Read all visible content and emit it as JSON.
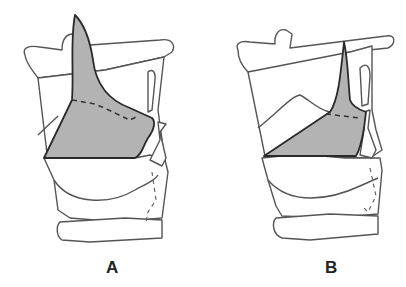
{
  "figure": {
    "panels": [
      {
        "label": "A",
        "description": "Lateral larynx diagram with large shaded epiglottic region"
      },
      {
        "label": "B",
        "description": "Lateral larynx diagram with smaller shaded region"
      }
    ],
    "colors": {
      "shade": "#b3b3b3",
      "outline": "#555555",
      "background": "#ffffff"
    }
  }
}
